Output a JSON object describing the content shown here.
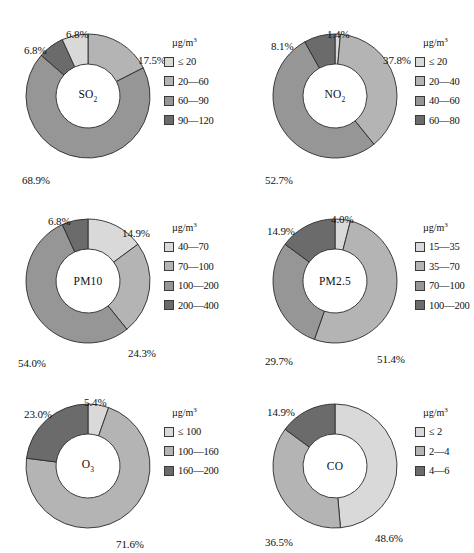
{
  "palette": {
    "s1": "#d9d9d9",
    "s2": "#b4b4b4",
    "s3": "#969696",
    "s4": "#6b6b6b",
    "stroke": "#2b2b2b",
    "hole": "#ffffff",
    "text": "#111111"
  },
  "legend_title": "µg/m³",
  "charts": [
    {
      "id": "so2",
      "center_label": "SO",
      "center_sub": "2",
      "legend_title": "µg/m³",
      "chart_data": {
        "type": "pie",
        "title": "SO2",
        "unit": "µg/m³",
        "categories": [
          "≤ 20",
          "20—60",
          "60—90",
          "90—120"
        ],
        "values": [
          6.8,
          17.5,
          68.9,
          6.8
        ],
        "labels": [
          "6.8%",
          "17.5%",
          "68.9%",
          "6.8%"
        ],
        "colors": [
          "#d9d9d9",
          "#b4b4b4",
          "#969696",
          "#6b6b6b"
        ],
        "order_from_top_clockwise": [
          "20—60",
          "60—90",
          "90—120",
          "≤ 20"
        ]
      },
      "slices": [
        {
          "label": "17.5%",
          "value": 17.5,
          "color": "#b4b4b4",
          "lx": 120,
          "ly": 28
        },
        {
          "label": "68.9%",
          "value": 68.9,
          "color": "#969696",
          "lx": 4,
          "ly": 148
        },
        {
          "label": "6.8%",
          "value": 6.8,
          "color": "#6b6b6b",
          "lx": 6,
          "ly": 18
        },
        {
          "label": "6.8%",
          "value": 6.8,
          "color": "#d9d9d9",
          "lx": 48,
          "ly": 2
        }
      ],
      "legend": [
        {
          "swatch": "#d9d9d9",
          "text": "≤ 20"
        },
        {
          "swatch": "#b4b4b4",
          "text": "20—60"
        },
        {
          "swatch": "#969696",
          "text": "60—90"
        },
        {
          "swatch": "#6b6b6b",
          "text": "90—120"
        }
      ]
    },
    {
      "id": "no2",
      "center_label": "NO",
      "center_sub": "2",
      "legend_title": "µg/m³",
      "chart_data": {
        "type": "pie",
        "title": "NO2",
        "unit": "µg/m³",
        "categories": [
          "≤ 20",
          "20—40",
          "40—60",
          "60—80"
        ],
        "values": [
          1.4,
          37.8,
          52.7,
          8.1
        ],
        "labels": [
          "1.4%",
          "37.8%",
          "52.7%",
          "8.1%"
        ],
        "colors": [
          "#d9d9d9",
          "#b4b4b4",
          "#969696",
          "#6b6b6b"
        ],
        "order_from_top_clockwise": [
          "≤ 20",
          "20—40",
          "40—60",
          "60—80"
        ]
      },
      "slices": [
        {
          "label": "1.4%",
          "value": 1.4,
          "color": "#d9d9d9",
          "lx": 62,
          "ly": 2
        },
        {
          "label": "37.8%",
          "value": 37.8,
          "color": "#b4b4b4",
          "lx": 118,
          "ly": 28
        },
        {
          "label": "52.7%",
          "value": 52.7,
          "color": "#969696",
          "lx": 0,
          "ly": 148
        },
        {
          "label": "8.1%",
          "value": 8.1,
          "color": "#6b6b6b",
          "lx": 6,
          "ly": 14
        }
      ],
      "legend": [
        {
          "swatch": "#d9d9d9",
          "text": "≤ 20"
        },
        {
          "swatch": "#b4b4b4",
          "text": "20—40"
        },
        {
          "swatch": "#969696",
          "text": "40—60"
        },
        {
          "swatch": "#6b6b6b",
          "text": "60—80"
        }
      ]
    },
    {
      "id": "pm10",
      "center_label": "PM10",
      "center_sub": "",
      "legend_title": "µg/m³",
      "chart_data": {
        "type": "pie",
        "title": "PM10",
        "unit": "µg/m³",
        "categories": [
          "40—70",
          "70—100",
          "100—200",
          "200—400"
        ],
        "values": [
          14.9,
          24.3,
          54.0,
          6.8
        ],
        "labels": [
          "14.9%",
          "24.3%",
          "54.0%",
          "6.8%"
        ],
        "colors": [
          "#d9d9d9",
          "#b4b4b4",
          "#969696",
          "#6b6b6b"
        ],
        "order_from_top_clockwise": [
          "40—70",
          "70—100",
          "100—200",
          "200—400"
        ]
      },
      "slices": [
        {
          "label": "14.9%",
          "value": 14.9,
          "color": "#d9d9d9",
          "lx": 104,
          "ly": 16
        },
        {
          "label": "24.3%",
          "value": 24.3,
          "color": "#b4b4b4",
          "lx": 110,
          "ly": 136
        },
        {
          "label": "54.0%",
          "value": 54.0,
          "color": "#969696",
          "lx": 0,
          "ly": 146
        },
        {
          "label": "6.8%",
          "value": 6.8,
          "color": "#6b6b6b",
          "lx": 30,
          "ly": 4
        }
      ],
      "legend": [
        {
          "swatch": "#d9d9d9",
          "text": "40—70"
        },
        {
          "swatch": "#b4b4b4",
          "text": "70—100"
        },
        {
          "swatch": "#969696",
          "text": "100—200"
        },
        {
          "swatch": "#6b6b6b",
          "text": "200—400"
        }
      ]
    },
    {
      "id": "pm25",
      "center_label": "PM2.5",
      "center_sub": "",
      "legend_title": "µg/m³",
      "chart_data": {
        "type": "pie",
        "title": "PM2.5",
        "unit": "µg/m³",
        "categories": [
          "15—35",
          "35—70",
          "70—100",
          "100—200"
        ],
        "values": [
          4.0,
          51.4,
          29.7,
          14.9
        ],
        "labels": [
          "4.0%",
          "51.4%",
          "29.7%",
          "14.9%"
        ],
        "colors": [
          "#d9d9d9",
          "#b4b4b4",
          "#969696",
          "#6b6b6b"
        ],
        "order_from_top_clockwise": [
          "15—35",
          "35—70",
          "70—100",
          "100—200"
        ]
      },
      "slices": [
        {
          "label": "4.0%",
          "value": 4.0,
          "color": "#d9d9d9",
          "lx": 66,
          "ly": 2
        },
        {
          "label": "51.4%",
          "value": 51.4,
          "color": "#b4b4b4",
          "lx": 112,
          "ly": 142
        },
        {
          "label": "29.7%",
          "value": 29.7,
          "color": "#969696",
          "lx": 0,
          "ly": 144
        },
        {
          "label": "14.9%",
          "value": 14.9,
          "color": "#6b6b6b",
          "lx": 2,
          "ly": 14
        }
      ],
      "legend": [
        {
          "swatch": "#d9d9d9",
          "text": "15—35"
        },
        {
          "swatch": "#b4b4b4",
          "text": "35—70"
        },
        {
          "swatch": "#969696",
          "text": "70—100"
        },
        {
          "swatch": "#6b6b6b",
          "text": "100—200"
        }
      ]
    },
    {
      "id": "o3",
      "center_label": "O",
      "center_sub": "3",
      "legend_title": "µg/m³",
      "chart_data": {
        "type": "pie",
        "title": "O3",
        "unit": "µg/m³",
        "categories": [
          "≤ 100",
          "100—160",
          "160—200"
        ],
        "values": [
          5.4,
          71.6,
          23.0
        ],
        "labels": [
          "5.4%",
          "71.6%",
          "23.0%"
        ],
        "colors": [
          "#d9d9d9",
          "#b4b4b4",
          "#6b6b6b"
        ],
        "order_from_top_clockwise": [
          "≤ 100",
          "100—160",
          "160—200"
        ]
      },
      "slices": [
        {
          "label": "5.4%",
          "value": 5.4,
          "color": "#d9d9d9",
          "lx": 66,
          "ly": 0
        },
        {
          "label": "71.6%",
          "value": 71.6,
          "color": "#b4b4b4",
          "lx": 98,
          "ly": 142
        },
        {
          "label": "23.0%",
          "value": 23.0,
          "color": "#6b6b6b",
          "lx": 6,
          "ly": 12
        }
      ],
      "legend": [
        {
          "swatch": "#d9d9d9",
          "text": "≤ 100"
        },
        {
          "swatch": "#b4b4b4",
          "text": "100—160"
        },
        {
          "swatch": "#6b6b6b",
          "text": "160—200"
        }
      ]
    },
    {
      "id": "co",
      "center_label": "CO",
      "center_sub": "",
      "legend_title": "µg/m³",
      "chart_data": {
        "type": "pie",
        "title": "CO",
        "unit": "µg/m³",
        "categories": [
          "≤ 2",
          "2—4",
          "4—6"
        ],
        "values": [
          48.6,
          36.5,
          14.9
        ],
        "labels": [
          "48.6%",
          "36.5%",
          "14.9%"
        ],
        "colors": [
          "#d9d9d9",
          "#b4b4b4",
          "#6b6b6b"
        ],
        "order_from_top_clockwise": [
          "≤ 2",
          "2—4",
          "4—6"
        ]
      },
      "slices": [
        {
          "label": "48.6%",
          "value": 48.6,
          "color": "#d9d9d9",
          "lx": 110,
          "ly": 136
        },
        {
          "label": "36.5%",
          "value": 36.5,
          "color": "#b4b4b4",
          "lx": 0,
          "ly": 140
        },
        {
          "label": "14.9%",
          "value": 14.9,
          "color": "#6b6b6b",
          "lx": 2,
          "ly": 10
        }
      ],
      "legend": [
        {
          "swatch": "#d9d9d9",
          "text": "≤ 2"
        },
        {
          "swatch": "#b4b4b4",
          "text": "2—4"
        },
        {
          "swatch": "#6b6b6b",
          "text": "4—6"
        }
      ]
    }
  ]
}
